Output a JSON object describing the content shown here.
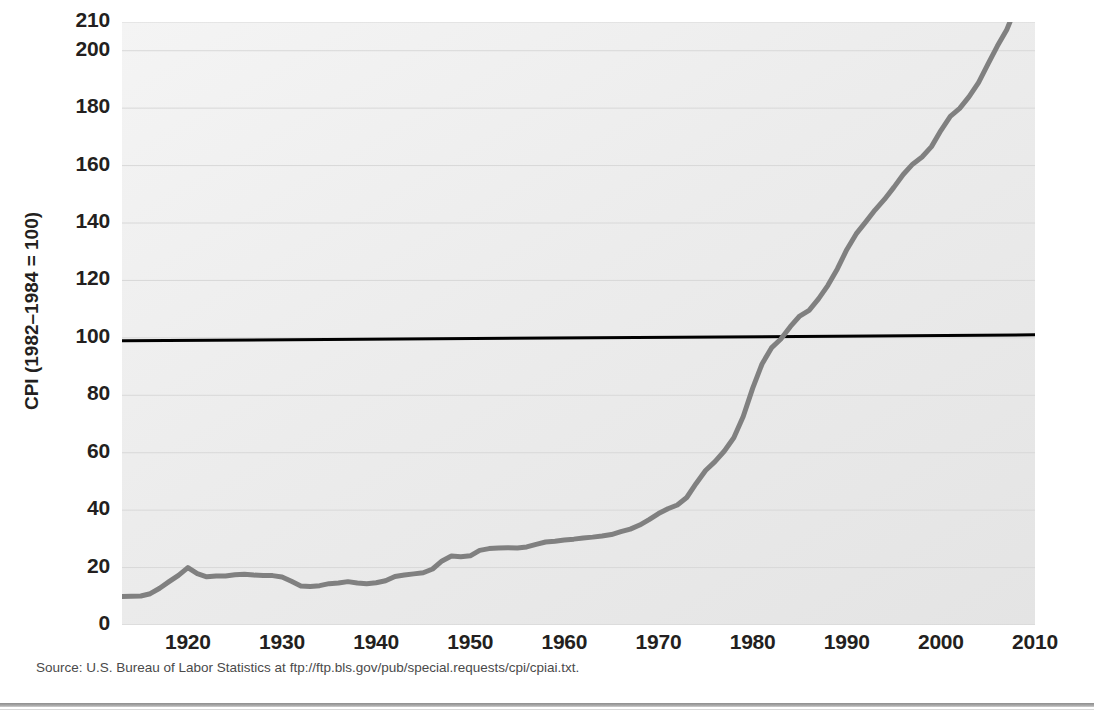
{
  "figure": {
    "source_note": "Source: U.S. Bureau of Labor Statistics at ftp://ftp.bls.gov/pub/special.requests/cpi/cpiai.txt.",
    "background_color": "#ececec",
    "line_color": "#808080",
    "reference_line_color": "#000000",
    "gridline_color": "#d8d8d8",
    "text_color": "#231f20"
  },
  "chart_data": {
    "type": "line",
    "title": "",
    "subtitle": "",
    "xlabel": "",
    "ylabel": "CPI (1982–1984 = 100)",
    "xlim": [
      1913,
      2010
    ],
    "ylim": [
      0,
      210
    ],
    "grid": true,
    "legend": "none",
    "xticks": [
      1920,
      1930,
      1940,
      1950,
      1960,
      1970,
      1980,
      1990,
      2000,
      2010
    ],
    "xtick_labels": [
      "1920",
      "1930",
      "1940",
      "1950",
      "1960",
      "1970",
      "1980",
      "1990",
      "2000",
      "2010"
    ],
    "yticks": [
      0,
      20,
      40,
      60,
      80,
      100,
      120,
      140,
      160,
      180,
      200,
      210
    ],
    "ytick_labels": [
      "0",
      "20",
      "40",
      "60",
      "80",
      "100",
      "120",
      "140",
      "160",
      "180",
      "200",
      "210"
    ],
    "annotations": [
      {
        "type": "reference-line",
        "value": 100,
        "label": "CPI = 100 base level",
        "color": "#000000"
      }
    ],
    "series": [
      {
        "name": "Consumer Price Index (CPI-U)",
        "color": "#808080",
        "x": [
          1913,
          1914,
          1915,
          1916,
          1917,
          1918,
          1919,
          1920,
          1921,
          1922,
          1923,
          1924,
          1925,
          1926,
          1927,
          1928,
          1929,
          1930,
          1931,
          1932,
          1933,
          1934,
          1935,
          1936,
          1937,
          1938,
          1939,
          1940,
          1941,
          1942,
          1943,
          1944,
          1945,
          1946,
          1947,
          1948,
          1949,
          1950,
          1951,
          1952,
          1953,
          1954,
          1955,
          1956,
          1957,
          1958,
          1959,
          1960,
          1961,
          1962,
          1963,
          1964,
          1965,
          1966,
          1967,
          1968,
          1969,
          1970,
          1971,
          1972,
          1973,
          1974,
          1975,
          1976,
          1977,
          1978,
          1979,
          1980,
          1981,
          1982,
          1983,
          1984,
          1985,
          1986,
          1987,
          1988,
          1989,
          1990,
          1991,
          1992,
          1993,
          1994,
          1995,
          1996,
          1997,
          1998,
          1999,
          2000,
          2001,
          2002,
          2003,
          2004,
          2005,
          2006,
          2007,
          2008,
          2009,
          2010
        ],
        "values": [
          9.9,
          10.0,
          10.1,
          10.9,
          12.8,
          15.1,
          17.3,
          20.0,
          17.9,
          16.8,
          17.1,
          17.1,
          17.5,
          17.7,
          17.4,
          17.2,
          17.2,
          16.7,
          15.2,
          13.6,
          13.4,
          13.7,
          14.4,
          14.6,
          15.1,
          14.6,
          14.4,
          14.7,
          15.4,
          16.9,
          17.4,
          17.8,
          18.2,
          19.5,
          22.3,
          24.0,
          23.8,
          24.1,
          26.0,
          26.6,
          26.8,
          26.9,
          26.8,
          27.2,
          28.1,
          28.9,
          29.2,
          29.6,
          29.9,
          30.3,
          30.6,
          31.0,
          31.5,
          32.5,
          33.4,
          34.8,
          36.7,
          38.8,
          40.5,
          41.8,
          44.4,
          49.3,
          53.8,
          56.9,
          60.6,
          65.2,
          72.6,
          82.4,
          90.9,
          96.5,
          99.6,
          103.9,
          107.6,
          109.6,
          113.6,
          118.3,
          124.0,
          130.7,
          136.2,
          140.3,
          144.5,
          148.2,
          152.4,
          156.9,
          160.5,
          163.0,
          166.6,
          172.2,
          177.1,
          179.9,
          184.0,
          188.9,
          195.3,
          201.6,
          207.3,
          215.3,
          214.5,
          218.1
        ]
      }
    ]
  }
}
